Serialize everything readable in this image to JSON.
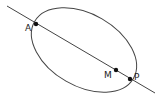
{
  "diagram": {
    "type": "geometry",
    "stroke_color": "#444444",
    "point_color": "#111111",
    "ellipse": {
      "cx": 84,
      "cy": 50,
      "rx": 57,
      "ry": 36,
      "rotation_deg": 30
    },
    "line": {
      "x1": 7,
      "y1": 6,
      "x2": 155,
      "y2": 93
    },
    "points": [
      {
        "id": "A",
        "label": "A",
        "x": 36,
        "y": 24,
        "label_x": 25,
        "label_y": 31
      },
      {
        "id": "M",
        "label": "M",
        "x": 116,
        "y": 70,
        "label_x": 104,
        "label_y": 78
      },
      {
        "id": "P",
        "label": "P",
        "x": 130,
        "y": 79,
        "label_x": 134,
        "label_y": 80
      }
    ]
  }
}
